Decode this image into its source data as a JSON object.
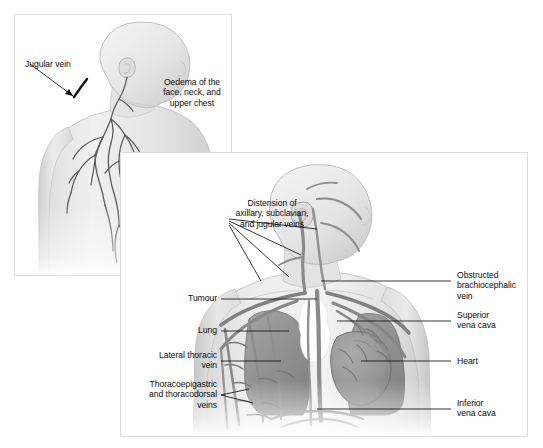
{
  "figure": {
    "panel_count": 2,
    "background_color": "#ffffff",
    "border_color": "#dcdcdc"
  },
  "panel1": {
    "name": "external-clinical-signs-panel",
    "labels": [
      {
        "id": "jugular-vein",
        "text": "Jugular vein",
        "align": "left"
      },
      {
        "id": "oedema",
        "text": "Oedema of the\nface, neck, and\nupper chest",
        "align": "center"
      }
    ],
    "anatomy": [
      "bald head in three-quarter profile",
      "distended jugular vein at neck",
      "network of dilated superficial chest veins",
      "shoulder and upper arm"
    ]
  },
  "panel2": {
    "name": "thoracic-anatomy-panel",
    "labels_left": [
      {
        "id": "distension",
        "text": "Distension of\naxillary, subclavian,\nand jugular veins",
        "align": "center"
      },
      {
        "id": "tumour",
        "text": "Tumour",
        "align": "right"
      },
      {
        "id": "lung",
        "text": "Lung",
        "align": "right"
      },
      {
        "id": "lateral-thoracic-vein",
        "text": "Lateral thoracic\nvein",
        "align": "right"
      },
      {
        "id": "thoracoepigastric",
        "text": "Thoracoepigastric\nand thoracodorsal\nveins",
        "align": "right"
      }
    ],
    "labels_right": [
      {
        "id": "obstructed-brachiocephalic-vein",
        "text": "Obstructed\nbrachiocephalic\nvein",
        "align": "left"
      },
      {
        "id": "superior-vena-cava",
        "text": "Superior\nvena cava",
        "align": "left"
      },
      {
        "id": "heart",
        "text": "Heart",
        "align": "left"
      },
      {
        "id": "inferior-vena-cava",
        "text": "Inferior\nvena cava",
        "align": "left"
      }
    ],
    "anatomy": [
      "head and torso, front view",
      "white irregular tumour mass beside mediastinum",
      "dark grey lungs",
      "mid-grey heart",
      "grey venous collateral network over chest and arms"
    ]
  },
  "palette": {
    "skin": "#e9e9e9",
    "skin_shade": "#d6d6d6",
    "vein": "#8a8a8a",
    "vein_dark": "#6e6e6e",
    "lung": "#8e8e8e",
    "heart": "#9b9b9b",
    "tumour": "#ffffff",
    "outline": "#6f6f6f",
    "leader": "#101010",
    "text": "#0b0b0b"
  }
}
